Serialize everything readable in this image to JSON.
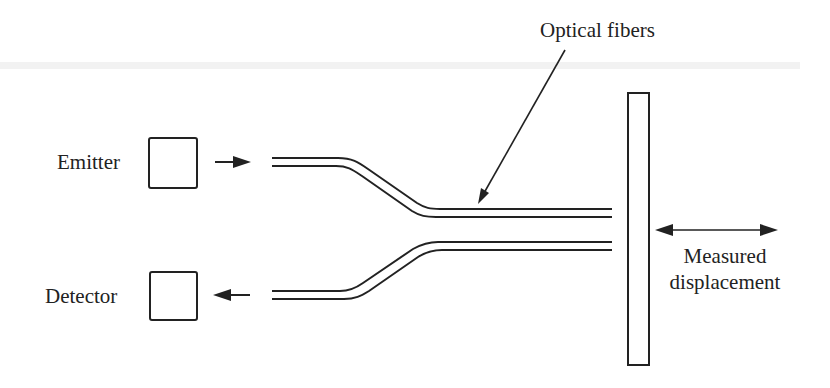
{
  "diagram": {
    "labels": {
      "optical_fibers": "Optical fibers",
      "emitter": "Emitter",
      "detector": "Detector",
      "measured": "Measured",
      "displacement": "displacement"
    },
    "colors": {
      "ink": "#222222",
      "background": "#ffffff",
      "scan_artifact": "#e6e6e6"
    },
    "components": [
      {
        "id": "emitter",
        "type": "box",
        "label": "Emitter"
      },
      {
        "id": "detector",
        "type": "box",
        "label": "Detector"
      },
      {
        "id": "fiber-transmit",
        "type": "fiber",
        "direction": "emitter-to-target"
      },
      {
        "id": "fiber-receive",
        "type": "fiber",
        "direction": "target-to-detector"
      },
      {
        "id": "target-plate",
        "type": "reflecting-surface"
      },
      {
        "id": "displacement-arrow",
        "type": "double-arrow",
        "label": "Measured displacement"
      }
    ]
  }
}
